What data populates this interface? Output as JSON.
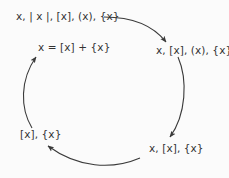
{
  "diagram": {
    "type": "cycle",
    "direction": "clockwise",
    "colors": {
      "background": "#fbfbfb",
      "text": "#333333",
      "arrow": "#3a3a3a"
    },
    "nodes": [
      {
        "id": "top-left",
        "label": "x, | x |, [x], (x), {x}"
      },
      {
        "id": "center-left",
        "label": "x = [x] + {x}"
      },
      {
        "id": "right",
        "label": "x, [x], (x), {x}"
      },
      {
        "id": "bottom-right",
        "label": "x, [x], {x}"
      },
      {
        "id": "bottom-left",
        "label": "[x], {x}"
      }
    ],
    "edges": [
      {
        "from": "top-left",
        "to": "right"
      },
      {
        "from": "right",
        "to": "bottom-right"
      },
      {
        "from": "bottom-right",
        "to": "bottom-left"
      },
      {
        "from": "bottom-left",
        "to": "center-left"
      }
    ]
  }
}
